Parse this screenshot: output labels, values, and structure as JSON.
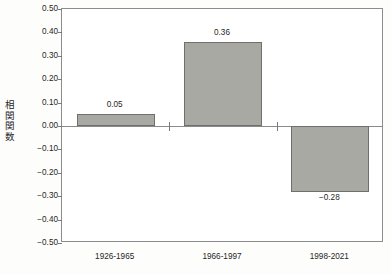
{
  "chart_data": {
    "type": "bar",
    "title": "",
    "subtitle": "",
    "xlabel": "",
    "ylabel": "相関関数",
    "categories": [
      "1926-1965",
      "1966-1997",
      "1998-2021"
    ],
    "values": [
      0.05,
      0.36,
      -0.28
    ],
    "value_labels": [
      "0.05",
      "0.36",
      "−0.28"
    ],
    "ylim": [
      -0.5,
      0.5
    ],
    "ytick_values": [
      0.5,
      0.4,
      0.3,
      0.2,
      0.1,
      0.0,
      -0.1,
      -0.2,
      -0.3,
      -0.4,
      -0.5
    ],
    "ytick_labels": [
      "0.50",
      "0.40",
      "0.30",
      "0.20",
      "0.10",
      "0.00",
      "−0.10",
      "−0.20",
      "−0.30",
      "−0.40",
      "−0.50"
    ],
    "grid": false,
    "legend": null,
    "series": [
      {
        "name": "相関関数",
        "values": [
          0.05,
          0.36,
          -0.28
        ]
      }
    ],
    "colors": {
      "bar_fill": "#a9a9a4",
      "bar_border": "#6f6f6b",
      "axis": "#8c8c8c",
      "text": "#1f1f1f",
      "background": "#ffffff"
    }
  }
}
